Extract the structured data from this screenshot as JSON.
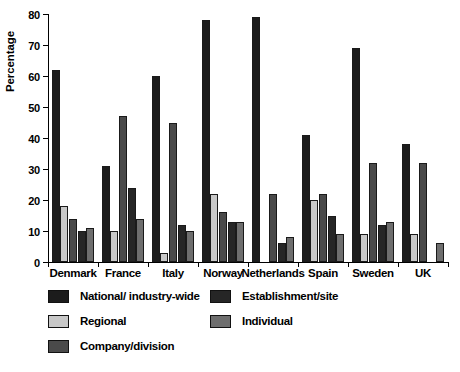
{
  "chart_data": {
    "type": "bar",
    "title": "",
    "xlabel": "",
    "ylabel": "Percentage",
    "ylim": [
      0,
      80
    ],
    "yticks": [
      0,
      10,
      20,
      30,
      40,
      50,
      60,
      70,
      80
    ],
    "ytick_labels": [
      "0",
      "10",
      "20",
      "30",
      "40",
      "50",
      "60",
      "70",
      "80"
    ],
    "grid": false,
    "legend_position": "bottom",
    "categories": [
      "Denmark",
      "France",
      "Italy",
      "Norway",
      "Netherlands",
      "Spain",
      "Sweden",
      "UK"
    ],
    "series": [
      {
        "name": "National/ industry-wide",
        "color": "#1c1c1c",
        "values": [
          62,
          31,
          60,
          78,
          79,
          41,
          69,
          38
        ]
      },
      {
        "name": "Regional",
        "color": "#c8c8c8",
        "values": [
          18,
          10,
          3,
          22,
          0,
          20,
          9,
          9
        ]
      },
      {
        "name": "Company/division",
        "color": "#4a4a4a",
        "values": [
          14,
          47,
          45,
          16,
          22,
          22,
          32,
          32
        ]
      },
      {
        "name": "Establishment/site",
        "color": "#262626",
        "values": [
          10,
          24,
          12,
          13,
          6,
          15,
          12,
          0
        ]
      },
      {
        "name": "Individual",
        "color": "#6e6e6e",
        "values": [
          11,
          14,
          10,
          13,
          8,
          9,
          13,
          6
        ]
      }
    ]
  }
}
